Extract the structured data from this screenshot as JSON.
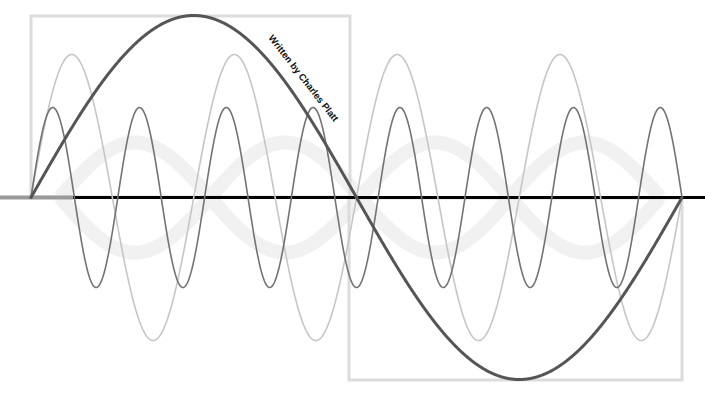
{
  "diagram": {
    "credit_text": "Written by Charles Platt",
    "colors": {
      "background": "#ffffff",
      "box": "#dcdcdc",
      "axis_left": "#9a9a9a",
      "axis_main": "#000000",
      "fundamental": "#555555",
      "harmonic_light": "#c6c6c6",
      "harmonic_dark": "#737373",
      "watermark": "#f1f1f1"
    },
    "geometry": {
      "x_start": 31,
      "x_end": 682,
      "midline_y": 197.5,
      "axis_gray_end_x": 73
    },
    "boxes": [
      {
        "name": "upper-half-cycle-box",
        "x": 31,
        "y": 16,
        "width": 319,
        "height": 181
      },
      {
        "name": "lower-half-cycle-box",
        "x": 349,
        "y": 198,
        "width": 333,
        "height": 182
      }
    ],
    "waves": [
      {
        "name": "fundamental-wave",
        "cycles": 1,
        "amplitude": 182,
        "stroke_width": 3,
        "color_key": "fundamental"
      },
      {
        "name": "light-harmonic-wave",
        "cycles": 4,
        "amplitude": 143,
        "stroke_width": 1.6,
        "color_key": "harmonic_light"
      },
      {
        "name": "dark-harmonic-wave",
        "cycles": 7.5,
        "amplitude": 90,
        "stroke_width": 1.6,
        "color_key": "harmonic_dark"
      }
    ]
  }
}
